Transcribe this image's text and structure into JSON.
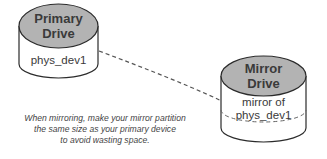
{
  "primary_drive": {
    "title_line1": "Primary",
    "title_line2": "Drive",
    "partition_label": "phys_dev1"
  },
  "mirror_drive": {
    "title_line1": "Mirror",
    "title_line2": "Drive",
    "partition_label_line1": "mirror of",
    "partition_label_line2": "phys_dev1"
  },
  "caption": {
    "line1": "When mirroring, make your mirror partition",
    "line2": "the same size as your primary device",
    "line3": "to avoid wasting space."
  },
  "colors": {
    "top_fill": "#b3b3b3",
    "body_fill": "#ffffff",
    "stroke": "#2b2b2b",
    "dashed": "#555555"
  }
}
